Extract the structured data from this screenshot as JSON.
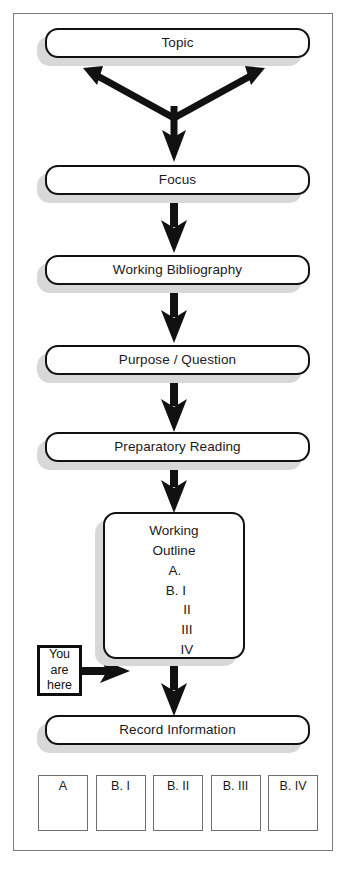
{
  "diagram": {
    "frame_border_color": "#7c7c7c",
    "box_border_color": "#111111",
    "shadow_color": "#d8d8d8",
    "arrow_color": "#111111"
  },
  "stages": [
    {
      "id": "topic",
      "label": "Topic"
    },
    {
      "id": "focus",
      "label": "Focus"
    },
    {
      "id": "working-bibliography",
      "label": "Working Bibliography"
    },
    {
      "id": "purpose-question",
      "label": "Purpose / Question"
    },
    {
      "id": "preparatory-reading",
      "label": "Preparatory Reading"
    },
    {
      "id": "record-information",
      "label": "Record Information"
    }
  ],
  "working_outline": {
    "heading_line_1": "Working",
    "heading_line_2": "Outline",
    "items": [
      "A.",
      "B. I",
      "II",
      "III",
      "IV"
    ]
  },
  "callout": {
    "line_1": "You",
    "line_2": "are",
    "line_3": "here"
  },
  "cards": [
    {
      "label": "A"
    },
    {
      "label": "B. I"
    },
    {
      "label": "B. II"
    },
    {
      "label": "B. III"
    },
    {
      "label": "B. IV"
    }
  ]
}
